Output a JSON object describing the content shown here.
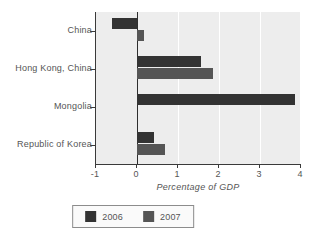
{
  "chart_data": {
    "type": "bar",
    "orientation": "horizontal",
    "title": "",
    "xlabel": "Percentage of GDP",
    "ylabel": "",
    "xlim": [
      -1,
      4
    ],
    "xticks": [
      "-1",
      "0",
      "1",
      "2",
      "3",
      "4"
    ],
    "xtick_values": [
      -1,
      0,
      1,
      2,
      3,
      4
    ],
    "grid": true,
    "grid_axis": "x",
    "legend_position": "bottom",
    "categories": [
      "China",
      "Hong Kong, China",
      "Mongolia",
      "Republic of Korea"
    ],
    "series": [
      {
        "name": "2006",
        "color": "#333333",
        "values": [
          -0.6,
          1.55,
          3.85,
          0.42
        ]
      },
      {
        "name": "2007",
        "color": "#555555",
        "values": [
          0.17,
          1.85,
          0,
          0.68
        ]
      }
    ]
  },
  "legend": {
    "items": [
      {
        "label": "2006",
        "color": "#333333"
      },
      {
        "label": "2007",
        "color": "#555555"
      }
    ]
  },
  "colors": {
    "plot_background": "#ededed",
    "gridline": "#ffffff",
    "axis": "#3a3a3a",
    "text": "#555555"
  }
}
